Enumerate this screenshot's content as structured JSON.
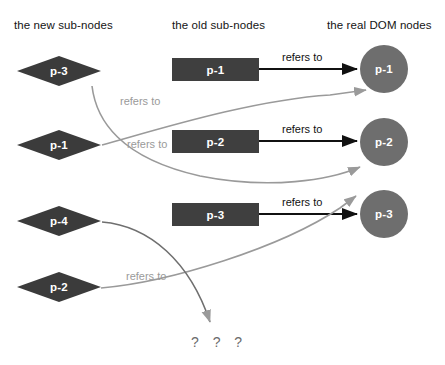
{
  "diagram": {
    "type": "node-reference-diagram",
    "columns": [
      {
        "id": "new-sub-nodes",
        "title": "the new sub-nodes"
      },
      {
        "id": "old-sub-nodes",
        "title": "the old sub-nodes"
      },
      {
        "id": "real-dom-nodes",
        "title": "the real DOM nodes"
      }
    ],
    "new_sub_nodes": [
      {
        "label": "p-3"
      },
      {
        "label": "p-1"
      },
      {
        "label": "p-4"
      },
      {
        "label": "p-2"
      }
    ],
    "old_sub_nodes": [
      {
        "label": "p-1"
      },
      {
        "label": "p-2"
      },
      {
        "label": "p-3"
      }
    ],
    "real_dom_nodes": [
      {
        "label": "p-1"
      },
      {
        "label": "p-2"
      },
      {
        "label": "p-3"
      }
    ],
    "edge_labels": {
      "black_1": "refers to",
      "black_2": "refers to",
      "black_3": "refers to",
      "gray_1": "refers to",
      "gray_2": "refers to",
      "gray_3": "refers to"
    },
    "unknown_target": "? ? ?",
    "colors": {
      "diamond_fill": "#3b3b3b",
      "rect_fill": "#3f3f3f",
      "circle_fill": "#6e6e6e",
      "node_text": "#ffffff",
      "black_edge": "#111111",
      "gray_edge": "#9a9a9a",
      "header_text": "#141414",
      "question_text": "#6b6b6b",
      "background": "#ffffff"
    }
  }
}
